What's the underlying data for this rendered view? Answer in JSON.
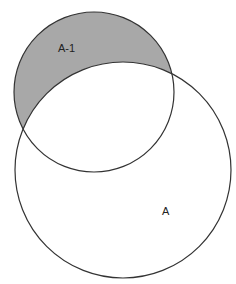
{
  "diagram": {
    "type": "venn",
    "circles": [
      {
        "id": "small",
        "label": "A-1",
        "cx": 94,
        "cy": 92,
        "r": 80,
        "shaded_region": "small minus large"
      },
      {
        "id": "large",
        "label": "A",
        "cx": 123,
        "cy": 170,
        "r": 108
      }
    ],
    "labels": {
      "small_circle": "A-1",
      "large_circle": "A"
    },
    "colors": {
      "shade": "#a8a8a8",
      "stroke": "#333333",
      "background": "#ffffff"
    }
  }
}
